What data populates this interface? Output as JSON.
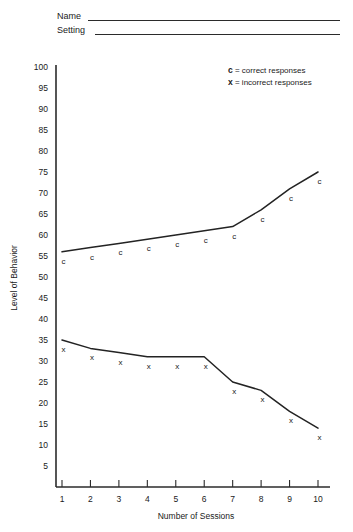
{
  "header": {
    "name_label": "Name",
    "setting_label": "Setting"
  },
  "legend": {
    "correct_key": "c",
    "correct_eq": "= correct responses",
    "incorrect_key": "x",
    "incorrect_eq": "= incorrect responses"
  },
  "chart_data": {
    "type": "line",
    "title": "",
    "xlabel": "Number of Sessions",
    "ylabel": "Level of Behavior",
    "x": [
      1,
      2,
      3,
      4,
      5,
      6,
      7,
      8,
      9,
      10
    ],
    "xticklabels": [
      "1",
      "2",
      "3",
      "4",
      "5",
      "6",
      "7",
      "8",
      "9",
      "10"
    ],
    "yticks": [
      5,
      10,
      15,
      20,
      25,
      30,
      35,
      40,
      45,
      50,
      55,
      60,
      65,
      70,
      75,
      80,
      85,
      90,
      95,
      100
    ],
    "yticklabels": [
      "5",
      "10",
      "15",
      "20",
      "25",
      "30",
      "35",
      "40",
      "45",
      "50",
      "55",
      "60",
      "65",
      "70",
      "75",
      "80",
      "85",
      "90",
      "95",
      "100"
    ],
    "xlim": [
      0.4,
      10.6
    ],
    "ylim": [
      0,
      100
    ],
    "grid": false,
    "legend_position": "top-right",
    "series": [
      {
        "name": "correct responses",
        "marker": "c",
        "values": [
          56,
          57,
          58,
          59,
          60,
          61,
          62,
          66,
          71,
          75
        ]
      },
      {
        "name": "incorrect responses",
        "marker": "x",
        "values": [
          35,
          33,
          32,
          31,
          31,
          31,
          25,
          23,
          18,
          14
        ]
      }
    ]
  }
}
